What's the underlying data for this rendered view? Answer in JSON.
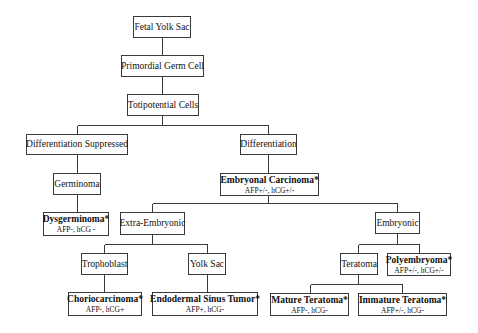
{
  "diagram": {
    "type": "tree",
    "footnote_marker": "*",
    "colors": {
      "line": "#3a3a3a",
      "box_border": "#3a3a3a",
      "text": "#111111",
      "background": "#ffffff"
    },
    "nodes": {
      "fetal_yolk_sac": {
        "label": "Fetal Yolk Sac"
      },
      "primordial_germ_cell": {
        "label": "Primordial Germ Cell"
      },
      "totipotential_cells": {
        "label": "Totipotential Cells"
      },
      "differentiation_suppressed": {
        "label": "Differentiation Suppressed"
      },
      "differentiation": {
        "label": "Differentiation"
      },
      "germinoma": {
        "label": "Germinoma"
      },
      "embryonal_carcinoma": {
        "label": "Embryonal Carcinoma*",
        "markers": "AFP+/-, hCG+/-"
      },
      "dysgerminoma": {
        "label": "Dysgerminoma*",
        "markers": "AFP-, hCG -"
      },
      "extra_embryonic": {
        "label": "Extra-Embryonic"
      },
      "embryonic": {
        "label": "Embryonic"
      },
      "trophoblast": {
        "label": "Trophoblast"
      },
      "yolk_sac": {
        "label": "Yolk Sac"
      },
      "teratoma": {
        "label": "Teratoma"
      },
      "polyembryoma": {
        "label": "Polyembryoma*",
        "markers": "AFP+/-, hCG+/-"
      },
      "choriocarcinoma": {
        "label": "Choriocarcinoma*",
        "markers": "AFP-, hCG+"
      },
      "endodermal_sinus_tumor": {
        "label": "Endodermal Sinus Tumor*",
        "markers": "AFP+, hCG-"
      },
      "mature_teratoma": {
        "label": "Mature Teratoma*",
        "markers": "AFP-, hCG-"
      },
      "immature_teratoma": {
        "label": "Immature Teratoma*",
        "markers": "AFP+/-, hCG-"
      }
    },
    "edges": [
      [
        "fetal_yolk_sac",
        "primordial_germ_cell"
      ],
      [
        "primordial_germ_cell",
        "totipotential_cells"
      ],
      [
        "totipotential_cells",
        "differentiation_suppressed"
      ],
      [
        "totipotential_cells",
        "differentiation"
      ],
      [
        "differentiation_suppressed",
        "germinoma"
      ],
      [
        "germinoma",
        "dysgerminoma"
      ],
      [
        "differentiation",
        "embryonal_carcinoma"
      ],
      [
        "embryonal_carcinoma",
        "extra_embryonic"
      ],
      [
        "embryonal_carcinoma",
        "embryonic"
      ],
      [
        "extra_embryonic",
        "trophoblast"
      ],
      [
        "extra_embryonic",
        "yolk_sac"
      ],
      [
        "trophoblast",
        "choriocarcinoma"
      ],
      [
        "yolk_sac",
        "endodermal_sinus_tumor"
      ],
      [
        "embryonic",
        "teratoma"
      ],
      [
        "embryonic",
        "polyembryoma"
      ],
      [
        "teratoma",
        "mature_teratoma"
      ],
      [
        "teratoma",
        "immature_teratoma"
      ]
    ]
  }
}
